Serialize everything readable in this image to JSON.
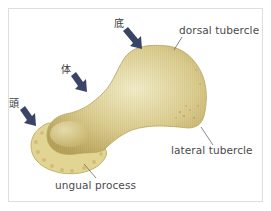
{
  "figure": {
    "colors": {
      "bone_base": "#d9c98a",
      "bone_highlight": "#f2ecc6",
      "bone_shadow": "#b8a65e",
      "arrow": "#3a4466",
      "leader_line": "#555555",
      "border": "#e4dcd8"
    }
  },
  "labels": {
    "dorsal_tubercle": "dorsal tubercle",
    "lateral_tubercle": "lateral tubercle",
    "ungual_process": "ungual process"
  },
  "arrow_labels": {
    "base": "底",
    "body": "体",
    "head": "頭"
  }
}
